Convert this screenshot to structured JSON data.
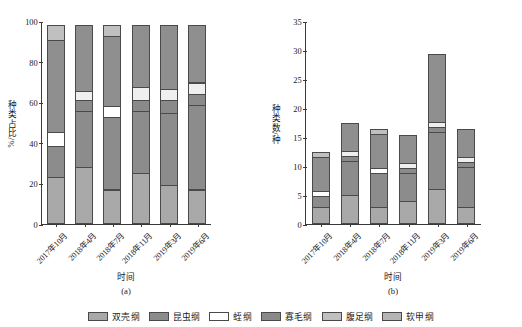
{
  "figure": {
    "caption_a": "(a)",
    "caption_b": "(b)"
  },
  "legend": {
    "items": [
      {
        "label": "双壳纲",
        "color": "#a9a9a9"
      },
      {
        "label": "昆虫纲",
        "color": "#8c8c8c"
      },
      {
        "label": "蛭纲",
        "color": "#ffffff"
      },
      {
        "label": "寡毛纲",
        "color": "#8a8a8a"
      },
      {
        "label": "腹足纲",
        "color": "#c0c0c0"
      },
      {
        "label": "软甲纲",
        "color": "#b5b5b5"
      }
    ]
  },
  "chart_data": [
    {
      "type": "bar",
      "id": "panel-a",
      "stacked": true,
      "title": "(a)",
      "xlabel": "时间",
      "ylabel": "种类占比/%",
      "categories": [
        "2017年10月",
        "2018年4月",
        "2018年7月",
        "2018年11月",
        "2019年3月",
        "2019年6月"
      ],
      "ylim": [
        0,
        100
      ],
      "yticks": [
        0,
        20,
        40,
        60,
        80,
        100
      ],
      "ytick_labels": [
        "0",
        "20",
        "40",
        "60",
        "80",
        "100"
      ],
      "grid": false,
      "legend_position": "bottom",
      "series": [
        {
          "name": "双壳纲",
          "color": "#a9a9a9",
          "values": [
            23,
            28,
            17,
            25,
            19,
            17
          ]
        },
        {
          "name": "昆虫纲",
          "color": "#8c8c8c",
          "values": [
            16,
            28,
            36,
            31,
            36,
            42
          ]
        },
        {
          "name": "蛭纲",
          "color": "#ffffff",
          "values": [
            7,
            0,
            6,
            0,
            0,
            0
          ]
        },
        {
          "name": "寡毛纲",
          "color": "#8a8a8a",
          "values": [
            0,
            6,
            0,
            6,
            7,
            6
          ]
        },
        {
          "name": "腹足纲",
          "color": "#efefef",
          "values": [
            0,
            5,
            0,
            7,
            6,
            6
          ]
        },
        {
          "name": "软甲纲",
          "color": "#8f8f8f",
          "values": [
            46,
            33,
            35,
            31,
            32,
            29
          ]
        },
        {
          "name": "顶层",
          "color": "#c0c0c0",
          "values": [
            8,
            0,
            6,
            0,
            0,
            0
          ]
        }
      ]
    },
    {
      "type": "bar",
      "id": "panel-b",
      "stacked": true,
      "title": "(b)",
      "xlabel": "时间",
      "ylabel": "种类数/种",
      "categories": [
        "2017年10月",
        "2018年4月",
        "2018年7月",
        "2018年11月",
        "2019年3月",
        "2019年6月"
      ],
      "ylim": [
        0,
        35
      ],
      "yticks": [
        0,
        5,
        10,
        15,
        20,
        25,
        30,
        35
      ],
      "ytick_labels": [
        "0",
        "5",
        "10",
        "15",
        "20",
        "25",
        "30",
        "35"
      ],
      "grid": false,
      "legend_position": "bottom",
      "totals": [
        13,
        18,
        17,
        16,
        30,
        17
      ],
      "series": [
        {
          "name": "双壳纲",
          "color": "#a9a9a9",
          "values": [
            3,
            5,
            3,
            4,
            6,
            3
          ]
        },
        {
          "name": "昆虫纲",
          "color": "#8c8c8c",
          "values": [
            2,
            6,
            6,
            5,
            10,
            7
          ]
        },
        {
          "name": "蛭纲",
          "color": "#ffffff",
          "values": [
            1,
            0,
            1,
            0,
            0,
            0
          ]
        },
        {
          "name": "寡毛纲",
          "color": "#8a8a8a",
          "values": [
            0,
            1,
            0,
            1,
            1,
            1
          ]
        },
        {
          "name": "腹足纲",
          "color": "#efefef",
          "values": [
            0,
            1,
            0,
            1,
            1,
            1
          ]
        },
        {
          "name": "软甲纲",
          "color": "#8f8f8f",
          "values": [
            6,
            5,
            6,
            5,
            12,
            5
          ]
        },
        {
          "name": "顶层",
          "color": "#c0c0c0",
          "values": [
            1,
            0,
            1,
            0,
            0,
            0
          ]
        }
      ]
    }
  ]
}
